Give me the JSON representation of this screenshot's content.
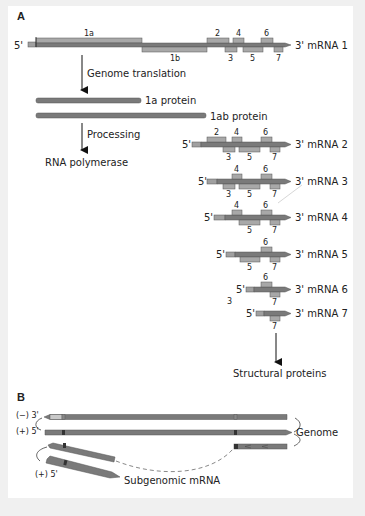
{
  "panels": {
    "a": {
      "label": "A"
    },
    "b": {
      "label": "B"
    }
  },
  "mrna1": {
    "five": "5'",
    "three": "3' mRNA 1",
    "orfs": {
      "o1a": "1a",
      "o1b": "1b",
      "o2": "2",
      "o3": "3",
      "o4": "4",
      "o5": "5",
      "o6": "6",
      "o7": "7"
    }
  },
  "steps": {
    "translation": "Genome translation",
    "processing": "Processing",
    "polymerase": "RNA polymerase",
    "structural": "Structural proteins"
  },
  "proteins": {
    "p1a": "1a protein",
    "p1ab": "1ab protein"
  },
  "subgenomic": [
    {
      "five": "5'",
      "three": "3' mRNA 2"
    },
    {
      "five": "5'",
      "three": "3' mRNA 3"
    },
    {
      "five": "5'",
      "three": "3' mRNA 4"
    },
    {
      "five": "5'",
      "three": "3' mRNA 5"
    },
    {
      "five": "5'",
      "three": "3' mRNA 6"
    },
    {
      "five": "5'",
      "three": "3' mRNA 7"
    }
  ],
  "orf_numbers": {
    "n2": "2",
    "n3": "3",
    "n4": "4",
    "n5": "5",
    "n6": "6",
    "n7": "7"
  },
  "stray_label": "3",
  "panel_b": {
    "minus_strand": "(−) 3'",
    "plus_strand": "(+) 5'",
    "plus_sub": "(+) 5'",
    "genome": "Genome",
    "subgenomic": "Subgenomic mRNA"
  },
  "colors": {
    "strand_dark": "#7a7a7a",
    "orf_light": "#a8a8a8",
    "outline": "#555555",
    "background": "#f0f0f0",
    "panel": "#ffffff"
  }
}
